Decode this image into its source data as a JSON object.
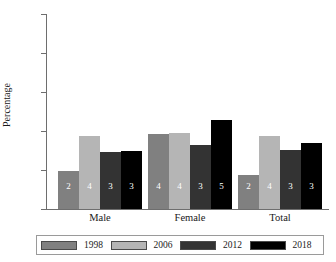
{
  "chart_data": {
    "type": "bar",
    "title": "",
    "xlabel": "",
    "ylabel": "Percentage",
    "categories": [
      "Male",
      "Female",
      "Total"
    ],
    "series": [
      {
        "name": "1998",
        "color": "#808080",
        "values": [
          1.95,
          3.85,
          1.72
        ],
        "labels": [
          "2",
          "4",
          "2"
        ]
      },
      {
        "name": "2006",
        "color": "#b5b5b5",
        "values": [
          3.75,
          3.92,
          3.75
        ],
        "labels": [
          "4",
          "4",
          "4"
        ]
      },
      {
        "name": "2012",
        "color": "#333333",
        "values": [
          2.9,
          3.28,
          3.05
        ],
        "labels": [
          "3",
          "3",
          "3"
        ]
      },
      {
        "name": "2018",
        "color": "#000000",
        "values": [
          2.98,
          4.55,
          3.4
        ],
        "labels": [
          "3",
          "5",
          "3"
        ]
      }
    ],
    "ylim": [
      0,
      10
    ],
    "yticks": [
      "0",
      "2",
      "4",
      "6",
      "8",
      "10"
    ],
    "grid": false,
    "legend_position": "bottom",
    "axis_color": "#6e6e6e"
  }
}
